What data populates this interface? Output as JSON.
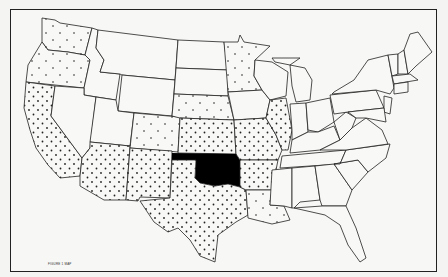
{
  "map": {
    "title": "United States",
    "highlighted_state": "Oklahoma",
    "highlight_color": "#000000",
    "dense_dot_states": [
      "California",
      "Arizona",
      "New Mexico",
      "Texas",
      "Kansas",
      "Missouri",
      "Arkansas",
      "Illinois"
    ],
    "caption": "FIGURE 1 MAP",
    "faint_marks": "0 1 0"
  }
}
